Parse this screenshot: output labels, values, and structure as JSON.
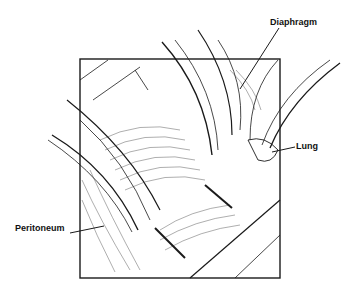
{
  "figure": {
    "labels": {
      "diaphragm": "Diaphragm",
      "lung": "Lung",
      "peritoneum": "Peritoneum"
    }
  }
}
